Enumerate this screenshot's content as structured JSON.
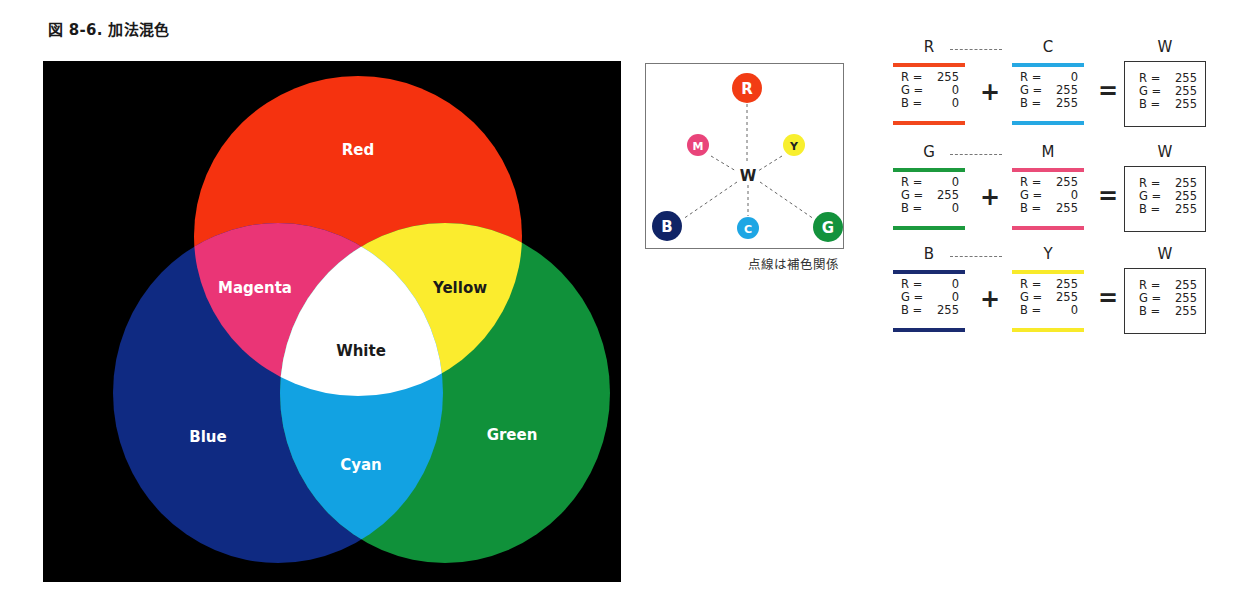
{
  "figure": {
    "title": "図 8-6. 加法混色"
  },
  "venn": {
    "background": "#000000",
    "circles": [
      {
        "name": "Red",
        "color": "#f5320f"
      },
      {
        "name": "Blue",
        "color": "#0f2a82"
      },
      {
        "name": "Green",
        "color": "#10913a"
      }
    ],
    "overlaps": [
      {
        "name": "Magenta",
        "color": "#ea3576"
      },
      {
        "name": "Yellow",
        "color": "#fbec2e"
      },
      {
        "name": "Cyan",
        "color": "#12a2e2"
      },
      {
        "name": "White",
        "color": "#ffffff"
      }
    ],
    "labels": {
      "red": "Red",
      "magenta": "Magenta",
      "yellow": "Yellow",
      "white": "White",
      "blue": "Blue",
      "cyan": "Cyan",
      "green": "Green"
    }
  },
  "wheel": {
    "nodes": {
      "R": {
        "label": "R",
        "color": "#f23c14"
      },
      "M": {
        "label": "M",
        "color": "#e9447a"
      },
      "Y": {
        "label": "Y",
        "color": "#f8ef2e"
      },
      "W": {
        "label": "W"
      },
      "B": {
        "label": "B",
        "color": "#102466"
      },
      "C": {
        "label": "C",
        "color": "#1ea6e4"
      },
      "G": {
        "label": "G",
        "color": "#13923c"
      }
    },
    "caption": "点線は補色関係"
  },
  "equations": [
    {
      "left": {
        "label": "R",
        "color": "#f2471c",
        "values": [
          [
            "R =",
            "255"
          ],
          [
            "G =",
            "0"
          ],
          [
            "B =",
            "0"
          ]
        ]
      },
      "op1": "+",
      "right": {
        "label": "C",
        "color": "#26a8e3",
        "values": [
          [
            "R =",
            "0"
          ],
          [
            "G =",
            "255"
          ],
          [
            "B =",
            "255"
          ]
        ]
      },
      "op2": "=",
      "result": {
        "label": "W",
        "values": [
          [
            "R =",
            "255"
          ],
          [
            "G =",
            "255"
          ],
          [
            "B =",
            "255"
          ]
        ]
      }
    },
    {
      "left": {
        "label": "G",
        "color": "#1c9a3e",
        "values": [
          [
            "R =",
            "0"
          ],
          [
            "G =",
            "255"
          ],
          [
            "B =",
            "0"
          ]
        ]
      },
      "op1": "+",
      "right": {
        "label": "M",
        "color": "#ea4c78",
        "values": [
          [
            "R =",
            "255"
          ],
          [
            "G =",
            "0"
          ],
          [
            "B =",
            "255"
          ]
        ]
      },
      "op2": "=",
      "result": {
        "label": "W",
        "values": [
          [
            "R =",
            "255"
          ],
          [
            "G =",
            "255"
          ],
          [
            "B =",
            "255"
          ]
        ]
      }
    },
    {
      "left": {
        "label": "B",
        "color": "#1a2b70",
        "values": [
          [
            "R =",
            "0"
          ],
          [
            "G =",
            "0"
          ],
          [
            "B =",
            "255"
          ]
        ]
      },
      "op1": "+",
      "right": {
        "label": "Y",
        "color": "#f8ea2a",
        "values": [
          [
            "R =",
            "255"
          ],
          [
            "G =",
            "255"
          ],
          [
            "B =",
            "0"
          ]
        ]
      },
      "op2": "=",
      "result": {
        "label": "W",
        "values": [
          [
            "R =",
            "255"
          ],
          [
            "G =",
            "255"
          ],
          [
            "B =",
            "255"
          ]
        ]
      }
    }
  ]
}
